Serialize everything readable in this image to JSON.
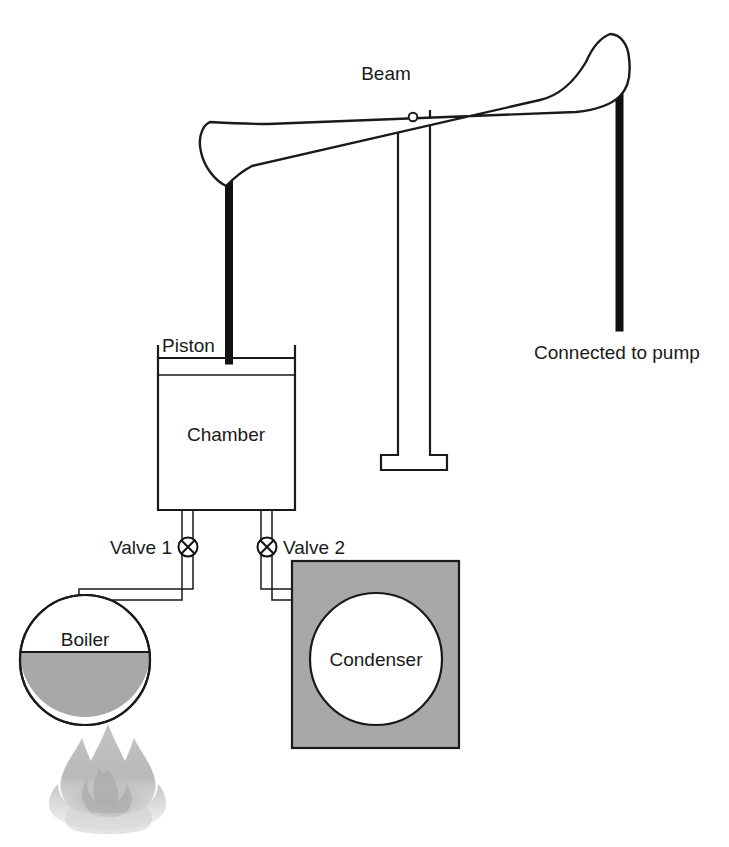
{
  "diagram": {
    "background_color": "#ffffff",
    "line_color": "#1a1a1a",
    "gray_fill_color": "#a8a8a8",
    "white_fill_color": "#ffffff"
  },
  "labels": {
    "beam": "Beam",
    "piston": "Piston",
    "chamber": "Chamber",
    "valve_1": "Valve 1",
    "valve_2": "Valve 2",
    "boiler": "Boiler",
    "condenser": "Condenser",
    "connected_to_pump": "Connected to pump"
  },
  "components": [
    {
      "name": "beam",
      "label": "Beam",
      "type": "rocking-beam",
      "description": "Tapered walking beam, bulbous at both ends, pivoted near center, tilted up to the right"
    },
    {
      "name": "pivot",
      "label": "",
      "type": "pivot-point",
      "description": "Small circular fulcrum hole near beam center"
    },
    {
      "name": "support-column",
      "label": "",
      "type": "column",
      "description": "White outlined vertical support post with T-shaped foot beneath beam pivot"
    },
    {
      "name": "piston-rod-left",
      "label": "",
      "type": "rod",
      "description": "Thick black rod from beam left end down into chamber piston"
    },
    {
      "name": "pump-rod-right",
      "label": "Connected to pump",
      "type": "rod",
      "description": "Thick black rod hanging from beam right end"
    },
    {
      "name": "piston",
      "label": "Piston",
      "type": "piston-plate",
      "description": "Horizontal plate inside the top of the chamber"
    },
    {
      "name": "chamber",
      "label": "Chamber",
      "type": "cylinder",
      "description": "Open-topped rectangular cylinder holding the piston"
    },
    {
      "name": "valve-1",
      "label": "Valve 1",
      "type": "valve",
      "description": "Crossed-circle valve on the pipe from boiler to chamber"
    },
    {
      "name": "valve-2",
      "label": "Valve 2",
      "type": "valve",
      "description": "Crossed-circle valve on the pipe from chamber to condenser"
    },
    {
      "name": "boiler",
      "label": "Boiler",
      "type": "vessel",
      "description": "Circular boiler, lower half filled gray with water, heated by flame"
    },
    {
      "name": "flame",
      "label": "",
      "type": "heat-source",
      "description": "Gray flame beneath the boiler"
    },
    {
      "name": "condenser",
      "label": "Condenser",
      "type": "vessel",
      "description": "White circular condenser inside a gray rectangular water jacket"
    }
  ]
}
